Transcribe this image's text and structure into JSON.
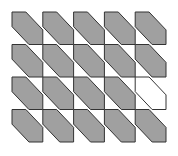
{
  "figure": {
    "type": "tile-grid",
    "rows": 4,
    "cols": 5,
    "origin": [
      12,
      12
    ],
    "cell_width": 30.8,
    "cell_height": 32.5,
    "shape": "diagonal-band-hexagon",
    "shape_points_fraction": [
      [
        0,
        0
      ],
      [
        0.45,
        0
      ],
      [
        1,
        0.55
      ],
      [
        1,
        1
      ],
      [
        0.55,
        1
      ],
      [
        0,
        0.45
      ]
    ],
    "fill_color": "#a0a0a0",
    "empty_fill_color": "#ffffff",
    "stroke_color": "#333333",
    "stroke_width": 1,
    "cells": [
      [
        "filled",
        "filled",
        "filled",
        "filled",
        "filled"
      ],
      [
        "filled",
        "filled",
        "filled",
        "filled",
        "filled"
      ],
      [
        "filled",
        "filled",
        "filled",
        "filled",
        "empty"
      ],
      [
        "filled",
        "filled",
        "filled",
        "filled",
        "filled"
      ]
    ]
  }
}
